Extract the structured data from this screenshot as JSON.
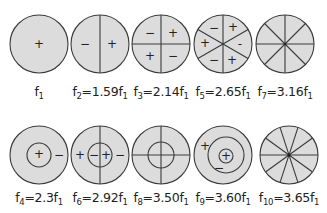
{
  "colors": {
    "fill": "#dcdcdc",
    "stroke": "#3a3a3a",
    "text": "#222222",
    "background": "#ffffff"
  },
  "modes": [
    {
      "id": "f1",
      "label_base": "f",
      "label_sub": "1",
      "label_eq": "",
      "ratio": "",
      "row": 0,
      "col": 0
    },
    {
      "id": "f2",
      "label_base": "f",
      "label_sub": "2",
      "label_eq": "=1.59f",
      "ratio": "1.59",
      "row": 0,
      "col": 1
    },
    {
      "id": "f3",
      "label_base": "f",
      "label_sub": "3",
      "label_eq": "=2.14f",
      "ratio": "2.14",
      "row": 0,
      "col": 2
    },
    {
      "id": "f5",
      "label_base": "f",
      "label_sub": "5",
      "label_eq": "=2.65f",
      "ratio": "2.65",
      "row": 0,
      "col": 3
    },
    {
      "id": "f7",
      "label_base": "f",
      "label_sub": "7",
      "label_eq": "=3.16f",
      "ratio": "3.16",
      "row": 0,
      "col": 4
    },
    {
      "id": "f4",
      "label_base": "f",
      "label_sub": "4",
      "label_eq": "=2.3f",
      "ratio": "2.3",
      "row": 1,
      "col": 0
    },
    {
      "id": "f6",
      "label_base": "f",
      "label_sub": "6",
      "label_eq": "=2.92f",
      "ratio": "2.92",
      "row": 1,
      "col": 1
    },
    {
      "id": "f8",
      "label_base": "f",
      "label_sub": "8",
      "label_eq": "=3.50f",
      "ratio": "3.50",
      "row": 1,
      "col": 2
    },
    {
      "id": "f9",
      "label_base": "f",
      "label_sub": "9",
      "label_eq": "=3.60f",
      "ratio": "3.60",
      "row": 1,
      "col": 3
    },
    {
      "id": "f10",
      "label_base": "f",
      "label_sub": "10",
      "label_eq": "=3.65f",
      "ratio": "3.65",
      "row": 1,
      "col": 4
    }
  ],
  "label_tail_sub": "1",
  "signs": {
    "plus": "+",
    "minus": "−"
  }
}
